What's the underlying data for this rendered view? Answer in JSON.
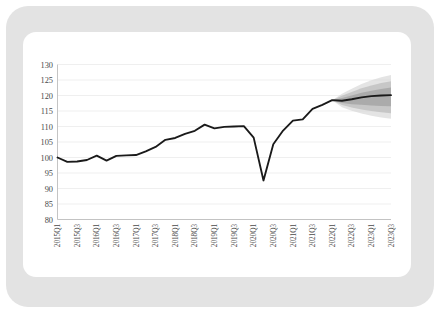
{
  "figure": {
    "frame_color": "#e3e3e3",
    "card_color": "#ffffff",
    "line_color": "#1a1a1a",
    "grid_color": "#ededed",
    "axis_color": "#bdbdbd",
    "tick_text_color": "#4a4a4a"
  },
  "chart_data": {
    "type": "line",
    "title": "",
    "subtitle": "",
    "xlabel": "",
    "ylabel": "",
    "ylim": [
      80,
      130
    ],
    "yticks": [
      130,
      125,
      120,
      115,
      110,
      105,
      100,
      95,
      90,
      85,
      80
    ],
    "ytick_labels": [
      "130",
      "125",
      "120",
      "115",
      "110",
      "105",
      "100",
      "95",
      "90",
      "85",
      "80"
    ],
    "grid": true,
    "grid_axis": "y",
    "legend": "none",
    "xtick_labels": [
      "2015Q1",
      "2015Q3",
      "2016Q1",
      "2016Q3",
      "2017Q1",
      "2017Q3",
      "2018Q1",
      "2018Q3",
      "2019Q1",
      "2019Q3",
      "2020Q1",
      "2020Q3",
      "2021Q1",
      "2021Q3",
      "2022Q1",
      "2022Q3",
      "2023Q1",
      "2023Q3"
    ],
    "xtick_rotation": -90,
    "x": [
      "2015Q1",
      "2015Q2",
      "2015Q3",
      "2015Q4",
      "2016Q1",
      "2016Q2",
      "2016Q3",
      "2016Q4",
      "2017Q1",
      "2017Q2",
      "2017Q3",
      "2017Q4",
      "2018Q1",
      "2018Q2",
      "2018Q3",
      "2018Q4",
      "2019Q1",
      "2019Q2",
      "2019Q3",
      "2019Q4",
      "2020Q1",
      "2020Q2",
      "2020Q3",
      "2020Q4",
      "2021Q1",
      "2021Q2",
      "2021Q3",
      "2021Q4",
      "2022Q1",
      "2022Q2",
      "2022Q3",
      "2022Q4",
      "2023Q1",
      "2023Q2",
      "2023Q3"
    ],
    "series": [
      {
        "name": "Index level (history and central projection)",
        "kind": "line",
        "values": [
          100.0,
          98.6,
          98.7,
          99.2,
          100.6,
          99.0,
          100.5,
          100.7,
          100.8,
          102.0,
          103.4,
          105.7,
          106.3,
          107.6,
          108.6,
          110.6,
          109.4,
          109.9,
          110.0,
          110.1,
          106.4,
          92.6,
          104.3,
          108.7,
          111.9,
          112.3,
          115.7,
          117.0,
          118.5,
          118.3,
          118.8,
          119.4,
          119.8,
          120.0,
          120.1
        ],
        "forecast_start": "2022Q1"
      }
    ],
    "fan_bands": {
      "description": "Nested grey fan-chart uncertainty intervals widening over the projection horizon",
      "start": "2022Q1",
      "end": "2023Q3",
      "intervals": [
        {
          "label": "30%",
          "color": "#9a9a9a",
          "upper": [
            118.5,
            119.2,
            120.0,
            120.9,
            121.5,
            122.1,
            122.6
          ],
          "lower": [
            118.5,
            117.6,
            117.2,
            117.0,
            116.8,
            116.6,
            116.5
          ]
        },
        {
          "label": "60%",
          "color": "#b5b5b5",
          "upper": [
            118.5,
            119.9,
            121.1,
            122.3,
            123.2,
            124.0,
            124.6
          ],
          "lower": [
            118.5,
            116.9,
            116.1,
            115.5,
            115.0,
            114.6,
            114.3
          ]
        },
        {
          "label": "90%",
          "color": "#d4d4d4",
          "upper": [
            118.5,
            120.6,
            122.2,
            123.7,
            124.9,
            125.9,
            126.6
          ],
          "lower": [
            118.5,
            116.2,
            115.1,
            114.2,
            113.5,
            112.9,
            112.5
          ]
        }
      ]
    }
  }
}
